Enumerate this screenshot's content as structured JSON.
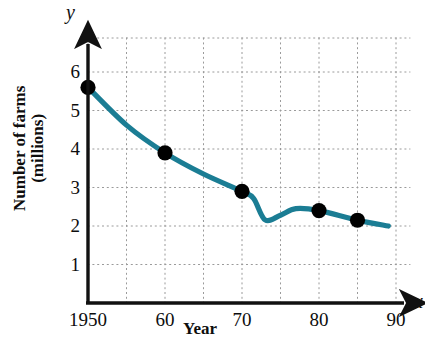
{
  "chart_data": {
    "type": "line",
    "title": "",
    "subtitle": "",
    "xlabel": "Year",
    "ylabel": "Number of farms (millions)",
    "x_axis_variable": "x",
    "y_axis_variable": "y",
    "xlim": [
      1950,
      1990
    ],
    "ylim": [
      0,
      6.6
    ],
    "xticks": [
      1950,
      1960,
      1970,
      1980,
      1990
    ],
    "xtick_labels": [
      "1950",
      "60",
      "70",
      "80",
      "90"
    ],
    "yticks": [
      1,
      2,
      3,
      4,
      5,
      6
    ],
    "ytick_labels": [
      "1",
      "2",
      "3",
      "4",
      "5",
      "6"
    ],
    "grid": true,
    "grid_style": "dotted",
    "grid_x_interval": 5,
    "grid_y_interval": 1,
    "legend": false,
    "legend_position": "none",
    "line_color": "#1b7d94",
    "marker_color": "#000000",
    "axis_color": "#111111",
    "grid_color": "#9a9a9a",
    "series": [
      {
        "name": "Number of farms",
        "marked_points": [
          {
            "x": 1950,
            "y": 5.6
          },
          {
            "x": 1960,
            "y": 3.9
          },
          {
            "x": 1970,
            "y": 2.9
          },
          {
            "x": 1980,
            "y": 2.4
          },
          {
            "x": 1985,
            "y": 2.15
          }
        ],
        "curve_points": [
          {
            "x": 1950,
            "y": 5.6
          },
          {
            "x": 1955,
            "y": 4.62
          },
          {
            "x": 1960,
            "y": 3.9
          },
          {
            "x": 1965,
            "y": 3.35
          },
          {
            "x": 1970,
            "y": 2.9
          },
          {
            "x": 1971.5,
            "y": 2.72
          },
          {
            "x": 1973,
            "y": 2.16
          },
          {
            "x": 1975,
            "y": 2.28
          },
          {
            "x": 1977,
            "y": 2.45
          },
          {
            "x": 1980,
            "y": 2.4
          },
          {
            "x": 1985,
            "y": 2.15
          },
          {
            "x": 1989,
            "y": 2.0
          }
        ]
      }
    ]
  },
  "geometry": {
    "x_of_1950": 88,
    "x_of_1990": 396,
    "px_per_year": 7.7,
    "y_of_0": 303,
    "y_of_6": 72,
    "px_per_unit": 38.5,
    "axis_top": 38,
    "axis_right": 410
  }
}
